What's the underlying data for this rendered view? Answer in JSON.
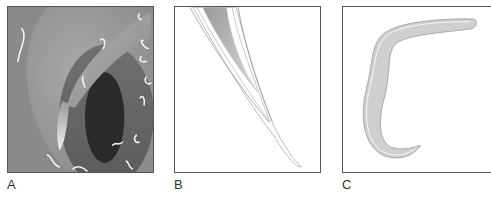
{
  "figure": {
    "panels": [
      {
        "id": "A",
        "label": "A",
        "description": "Shaded illustration: curved gray tissue folds surrounding a dark elongated opening, with small white wavy worm-like shapes scattered"
      },
      {
        "id": "B",
        "label": "B",
        "description": "Line drawing of a tapering needle-like structure entering diagonally from top, with gray shaded interior"
      },
      {
        "id": "C",
        "label": "C",
        "description": "Line drawing of a C-shaped curved worm-like organism with light gray fill and white outline"
      }
    ]
  },
  "colors": {
    "panel_a_bg": "#8a8a8a",
    "dark_opening": "#2a2a2a",
    "worm_fill": "#cfcfcf",
    "border": "#555555"
  }
}
